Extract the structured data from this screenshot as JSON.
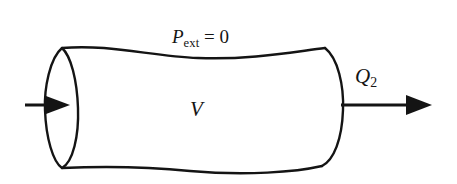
{
  "figure": {
    "name": "deformable-control-volume-diagram",
    "background_color": "#ffffff",
    "stroke_color": "#141414",
    "labels": {
      "external_pressure": {
        "symbol": "P",
        "subscript": "ext",
        "relation": " = ",
        "value": "0",
        "full_text": "P_ext = 0"
      },
      "volume": {
        "symbol": "V",
        "full_text": "V"
      },
      "outlet_flow": {
        "symbol": "Q",
        "subscript": "2",
        "full_text": "Q_2"
      }
    },
    "arrows": {
      "inlet": {
        "name": "inlet-flow-arrow",
        "direction": "right",
        "label": ""
      },
      "outlet": {
        "name": "outlet-flow-arrow",
        "direction": "right",
        "label": "Q_2"
      }
    },
    "shapes": {
      "left_opening": "full-ellipse",
      "right_cap": "half-ellipse",
      "body": "wavy-tube"
    }
  }
}
